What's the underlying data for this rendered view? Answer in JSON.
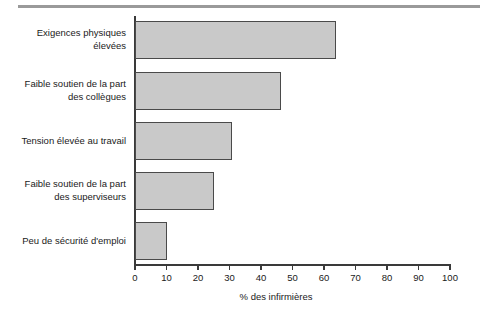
{
  "chart_data": {
    "type": "bar",
    "orientation": "horizontal",
    "title": "",
    "xlabel": "% des infirmières",
    "ylabel": "",
    "xlim": [
      0,
      100
    ],
    "xticks": [
      0,
      10,
      20,
      30,
      40,
      50,
      60,
      70,
      80,
      90,
      100
    ],
    "grid": false,
    "legend": false,
    "bar_color": "#c9c9c9",
    "bar_edge_color": "#4a4a4a",
    "categories": [
      "Exigences physiques élevées",
      "Faible soutien de la part des collègues",
      "Tension élevée au travail",
      "Faible soutien de la part des superviseurs",
      "Peu de sécurité d'emploi"
    ],
    "category_lines": [
      [
        "Exigences physiques",
        "élevées"
      ],
      [
        "Faible soutien de la part",
        "des collègues"
      ],
      [
        "Tension élevée au travail"
      ],
      [
        "Faible soutien de la part",
        "des superviseurs"
      ],
      [
        "Peu de sécurité d'emploi"
      ]
    ],
    "values": [
      63.5,
      46,
      30.5,
      25,
      10
    ]
  },
  "axis": {
    "tick_0": "0",
    "tick_10": "10",
    "tick_20": "20",
    "tick_30": "30",
    "tick_40": "40",
    "tick_50": "50",
    "tick_60": "60",
    "tick_70": "70",
    "tick_80": "80",
    "tick_90": "90",
    "tick_100": "100",
    "x_title": "% des infirmières"
  },
  "labels": {
    "cat1_line1": "Exigences physiques",
    "cat1_line2": "élevées",
    "cat2_line1": "Faible soutien de la part",
    "cat2_line2": "des collègues",
    "cat3_line1": "Tension élevée au travail",
    "cat4_line1": "Faible soutien de la part",
    "cat4_line2": "des superviseurs",
    "cat5_line1": "Peu de sécurité d'emploi"
  }
}
